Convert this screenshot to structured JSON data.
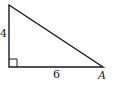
{
  "diagram": {
    "type": "right-triangle",
    "labels": {
      "vertical_leg": "4",
      "horizontal_leg": "6",
      "vertex": "A"
    },
    "vertices": {
      "top": [
        9,
        5
      ],
      "right_angle": [
        9,
        67
      ],
      "A": [
        103,
        67
      ]
    },
    "right_angle_marker_size": 8,
    "stroke_color": "#1a1a1a",
    "background_color": "#ffffff"
  }
}
